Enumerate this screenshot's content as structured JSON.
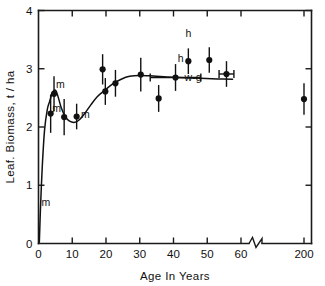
{
  "chart_data": {
    "type": "scatter",
    "title": "",
    "xlabel": "Age In Years",
    "ylabel": "Leaf. Biomass, t / ha",
    "xlim": [
      0,
      60
    ],
    "ylim": [
      0,
      4
    ],
    "grid": false,
    "legend": "none",
    "axis_break": {
      "present": true,
      "after": 60,
      "resumes_at": 200,
      "note": "x-axis broken between 60 and 200"
    },
    "x_ticks": [
      0,
      10,
      20,
      30,
      40,
      50,
      60,
      200
    ],
    "x_tick_labels": [
      "0",
      "10",
      "20",
      "30",
      "40",
      "50",
      "60",
      "200"
    ],
    "y_ticks": [
      0,
      1,
      2,
      3,
      4
    ],
    "y_tick_labels": [
      "0",
      "1",
      "2",
      "3",
      "4"
    ],
    "points": [
      {
        "x": 0.6,
        "y": 0.6,
        "yerr": 0.0,
        "xerr": 0,
        "label": "m"
      },
      {
        "x": 3.6,
        "y": 2.23,
        "yerr": 0.33,
        "xerr": 0,
        "label": "m"
      },
      {
        "x": 4.6,
        "y": 2.57,
        "yerr": 0.3,
        "xerr": 0,
        "label": "m"
      },
      {
        "x": 7.6,
        "y": 2.17,
        "yerr": 0.31,
        "xerr": 0,
        "label": ""
      },
      {
        "x": 11.3,
        "y": 2.18,
        "yerr": 0.22,
        "xerr": 0,
        "label": "m"
      },
      {
        "x": 19.0,
        "y": 2.99,
        "yerr": 0.26,
        "xerr": 0,
        "label": ""
      },
      {
        "x": 19.8,
        "y": 2.61,
        "yerr": 0.23,
        "xerr": 0,
        "label": ""
      },
      {
        "x": 22.8,
        "y": 2.75,
        "yerr": 0.23,
        "xerr": 0,
        "label": ""
      },
      {
        "x": 30.3,
        "y": 2.9,
        "yerr": 0.29,
        "xerr": 0,
        "label": ""
      },
      {
        "x": 35.6,
        "y": 2.49,
        "yerr": 0.23,
        "xerr": 0,
        "label": ""
      },
      {
        "x": 40.6,
        "y": 2.85,
        "yerr": 0.23,
        "xerr": 7.5,
        "label": "w-g"
      },
      {
        "x": 44.4,
        "y": 3.13,
        "yerr": 0.22,
        "xerr": 0,
        "label": "h"
      },
      {
        "x": 50.6,
        "y": 3.15,
        "yerr": 0.22,
        "xerr": 0,
        "label": ""
      },
      {
        "x": 55.7,
        "y": 2.91,
        "yerr": 0.22,
        "xerr": 2.2,
        "label": ""
      },
      {
        "x": 200,
        "y": 2.48,
        "yerr": 0.27,
        "xerr": 0,
        "label": ""
      }
    ],
    "annotations": [
      {
        "text": "m",
        "x": 0.9,
        "y": 0.7,
        "anchor": "start"
      },
      {
        "text": "m",
        "x": 4.1,
        "y": 2.32,
        "anchor": "start"
      },
      {
        "text": "m",
        "x": 5.2,
        "y": 2.73,
        "anchor": "start"
      },
      {
        "text": "m",
        "x": 12.6,
        "y": 2.22,
        "anchor": "start"
      },
      {
        "text": "h",
        "x": 43.0,
        "y": 3.18,
        "anchor": "end"
      },
      {
        "text": "h",
        "x": 44.4,
        "y": 3.6,
        "anchor": "middle"
      },
      {
        "text": "w-g",
        "x": 45.8,
        "y": 2.85,
        "anchor": "middle"
      }
    ],
    "fit_curve": [
      {
        "x": 0.25,
        "y": 0.02
      },
      {
        "x": 0.55,
        "y": 0.55
      },
      {
        "x": 1.1,
        "y": 1.3
      },
      {
        "x": 1.8,
        "y": 1.95
      },
      {
        "x": 2.6,
        "y": 2.3
      },
      {
        "x": 3.3,
        "y": 2.44
      },
      {
        "x": 4.0,
        "y": 2.57
      },
      {
        "x": 4.6,
        "y": 2.63
      },
      {
        "x": 5.2,
        "y": 2.62
      },
      {
        "x": 5.9,
        "y": 2.5
      },
      {
        "x": 6.8,
        "y": 2.32
      },
      {
        "x": 7.9,
        "y": 2.18
      },
      {
        "x": 9.2,
        "y": 2.1
      },
      {
        "x": 10.8,
        "y": 2.08
      },
      {
        "x": 12.2,
        "y": 2.13
      },
      {
        "x": 13.8,
        "y": 2.24
      },
      {
        "x": 15.5,
        "y": 2.38
      },
      {
        "x": 17.4,
        "y": 2.52
      },
      {
        "x": 19.6,
        "y": 2.63
      },
      {
        "x": 22.0,
        "y": 2.74
      },
      {
        "x": 24.5,
        "y": 2.82
      },
      {
        "x": 27.0,
        "y": 2.87
      },
      {
        "x": 30.0,
        "y": 2.885
      },
      {
        "x": 34.0,
        "y": 2.875
      },
      {
        "x": 38.0,
        "y": 2.86
      },
      {
        "x": 43.0,
        "y": 2.845
      },
      {
        "x": 48.0,
        "y": 2.835
      },
      {
        "x": 53.0,
        "y": 2.825
      },
      {
        "x": 57.5,
        "y": 2.82
      }
    ]
  }
}
